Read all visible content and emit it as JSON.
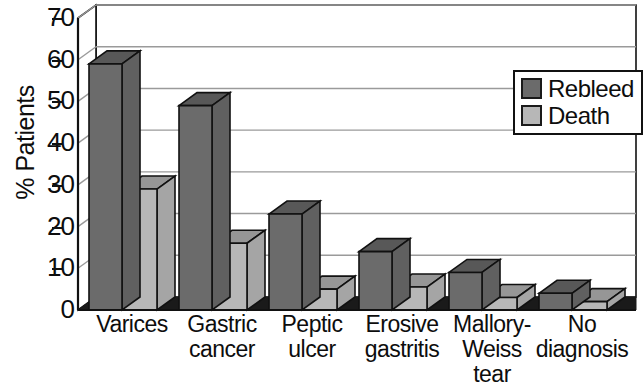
{
  "chart_data": {
    "type": "bar",
    "title": "",
    "subtitle": "",
    "xlabel": "",
    "ylabel": "% Patients",
    "ylim": [
      0,
      70
    ],
    "ytick_step": 10,
    "yticks": [
      0,
      10,
      20,
      30,
      40,
      50,
      60,
      70
    ],
    "ytick_labels": [
      "0",
      "10",
      "20",
      "30",
      "40",
      "50",
      "60",
      "70"
    ],
    "grid": true,
    "grid_axis": "y",
    "legend_position": "upper right",
    "style": "3d-bar",
    "categories": [
      "Varices",
      "Gastric cancer",
      "Peptic ulcer",
      "Erosive gastritis",
      "Mallory-Weiss tear",
      "No diagnosis"
    ],
    "category_lines": [
      [
        "Varices"
      ],
      [
        "Gastric",
        "cancer"
      ],
      [
        "Peptic",
        "ulcer"
      ],
      [
        "Erosive",
        "gastritis"
      ],
      [
        "Mallory-",
        "Weiss",
        "tear"
      ],
      [
        "No",
        "diagnosis"
      ]
    ],
    "series": [
      {
        "name": "Rebleed",
        "color": "#6b6b6b",
        "values": [
          59,
          49,
          23,
          14,
          9,
          4
        ]
      },
      {
        "name": "Death",
        "color": "#b7b7b7",
        "values": [
          29,
          16,
          5,
          5.5,
          3,
          2
        ]
      }
    ]
  },
  "legend": {
    "items": [
      {
        "label": "Rebleed",
        "color": "#6b6b6b"
      },
      {
        "label": "Death",
        "color": "#b7b7b7"
      }
    ]
  },
  "colors": {
    "rebleed": "#6b6b6b",
    "death": "#b7b7b7",
    "axis": "#111111",
    "grid": "#9a9a9a",
    "floor_shadow": "#1a1a1a",
    "background": "#ffffff"
  }
}
